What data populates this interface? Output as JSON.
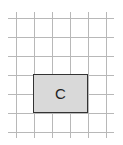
{
  "diagram": {
    "grid": {
      "vertical_x": [
        16,
        34,
        52,
        70,
        88,
        106
      ],
      "horizontal_y": [
        18,
        37,
        56,
        75,
        94,
        113,
        132
      ],
      "color": "#b8b8b8"
    },
    "shape": {
      "label": "C",
      "fill": "#d9d9d9",
      "border": "#333333"
    }
  }
}
